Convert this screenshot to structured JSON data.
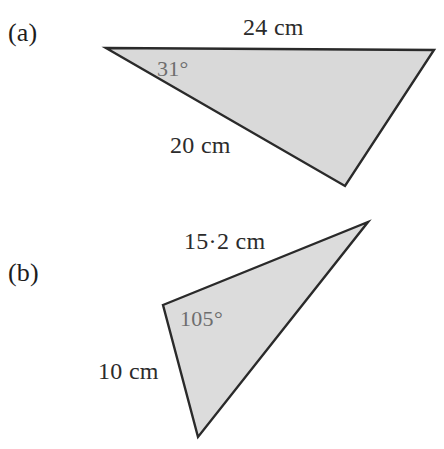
{
  "figure": {
    "background_color": "#ffffff",
    "stroke_color": "#2a2a2a",
    "fill_color": "#d9d9d9",
    "parts": [
      {
        "id": "a",
        "part_label": "(a)",
        "shape": "triangle",
        "vertices": [
          [
            106,
            48
          ],
          [
            434,
            50
          ],
          [
            345,
            186
          ]
        ],
        "labels": {
          "top_side": "24 cm",
          "bottom_side": "20 cm",
          "angle": "31°"
        }
      },
      {
        "id": "b",
        "part_label": "(b)",
        "shape": "triangle",
        "vertices": [
          [
            163,
            305
          ],
          [
            368,
            222
          ],
          [
            198,
            437
          ]
        ],
        "labels": {
          "top_side": "15·2 cm",
          "left_side": "10 cm",
          "angle": "105°"
        }
      }
    ]
  }
}
